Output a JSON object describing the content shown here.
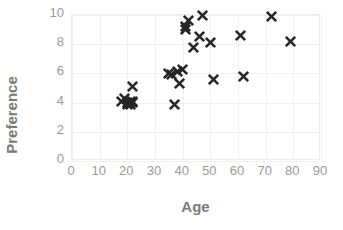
{
  "chart_data": {
    "type": "scatter",
    "title": "",
    "xlabel": "Age",
    "ylabel": "Preference",
    "xlim": [
      0,
      90
    ],
    "ylim": [
      0,
      10
    ],
    "xticks": [
      0,
      10,
      20,
      30,
      40,
      50,
      60,
      70,
      80,
      90
    ],
    "yticks": [
      0,
      2,
      4,
      6,
      8,
      10
    ],
    "grid": true,
    "legend": null,
    "marker": "x",
    "marker_color": "#262626",
    "series": [
      {
        "name": "Preference vs Age",
        "points": [
          [
            18,
            4.1
          ],
          [
            19,
            4.3
          ],
          [
            20,
            4.0
          ],
          [
            20,
            3.9
          ],
          [
            21,
            4.1
          ],
          [
            21,
            3.9
          ],
          [
            22,
            4.1
          ],
          [
            22,
            4.0
          ],
          [
            22,
            5.1
          ],
          [
            35,
            6.0
          ],
          [
            36,
            5.9
          ],
          [
            37,
            3.9
          ],
          [
            38,
            6.1
          ],
          [
            39,
            5.3
          ],
          [
            40,
            6.3
          ],
          [
            41,
            9.2
          ],
          [
            41,
            9.0
          ],
          [
            42,
            9.6
          ],
          [
            44,
            7.8
          ],
          [
            46,
            8.5
          ],
          [
            47,
            10.0
          ],
          [
            50,
            8.1
          ],
          [
            51,
            5.6
          ],
          [
            61,
            8.6
          ],
          [
            62,
            5.8
          ],
          [
            72,
            9.9
          ],
          [
            79,
            8.2
          ]
        ]
      }
    ]
  },
  "axes": {
    "x_title": "Age",
    "y_title": "Preference"
  }
}
